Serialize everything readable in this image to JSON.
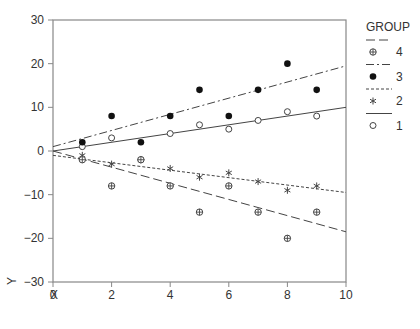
{
  "chart_data": {
    "type": "scatter",
    "title": "",
    "xlabel": "X",
    "ylabel": "Y",
    "xlim": [
      0,
      10
    ],
    "ylim": [
      -30,
      30
    ],
    "xticks": [
      0,
      2,
      4,
      6,
      8,
      10
    ],
    "yticks": [
      -30,
      -20,
      -10,
      0,
      10,
      20,
      30
    ],
    "grid": false,
    "legend": {
      "title": "GROUP",
      "position": "right",
      "entries": [
        "4",
        "3",
        "2",
        "1"
      ]
    },
    "series": [
      {
        "name": "1",
        "marker": "open-circle",
        "line": "solid",
        "x": [
          1,
          2,
          3,
          4,
          5,
          6,
          7,
          8,
          9
        ],
        "y": [
          1,
          3,
          -2,
          4,
          6,
          5,
          7,
          9,
          8
        ],
        "fit": [
          [
            0,
            0
          ],
          [
            10,
            10
          ]
        ]
      },
      {
        "name": "2",
        "marker": "asterisk",
        "line": "dotted",
        "x": [
          1,
          2,
          3,
          4,
          5,
          6,
          7,
          8,
          9
        ],
        "y": [
          -1,
          -3,
          -2,
          -4,
          -6,
          -5,
          -7,
          -9,
          -8
        ],
        "fit": [
          [
            0,
            -1
          ],
          [
            10,
            -9.5
          ]
        ]
      },
      {
        "name": "3",
        "marker": "filled-circle",
        "line": "dash-dot",
        "x": [
          1,
          2,
          3,
          4,
          5,
          6,
          7,
          8,
          9
        ],
        "y": [
          2,
          8,
          2,
          8,
          14,
          8,
          14,
          20,
          14
        ],
        "fit": [
          [
            0,
            1
          ],
          [
            10,
            19.5
          ]
        ]
      },
      {
        "name": "4",
        "marker": "circle-plus",
        "line": "dashed",
        "x": [
          1,
          2,
          3,
          4,
          5,
          6,
          7,
          8,
          9
        ],
        "y": [
          -2,
          -8,
          -2,
          -8,
          -14,
          -8,
          -14,
          -20,
          -14
        ],
        "fit": [
          [
            0,
            0
          ],
          [
            10,
            -18.5
          ]
        ]
      }
    ]
  }
}
